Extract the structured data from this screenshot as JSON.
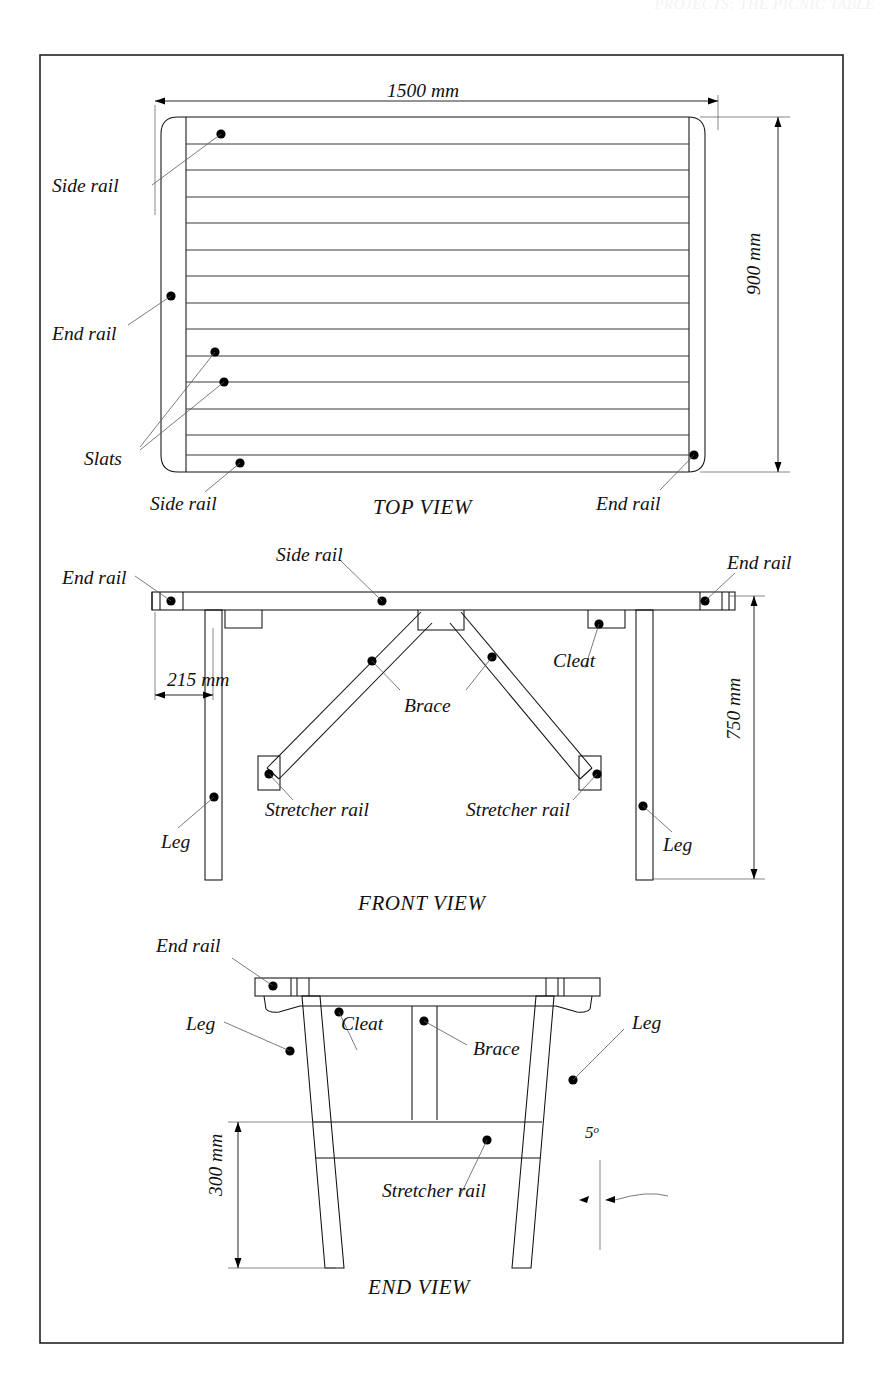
{
  "document": {
    "header_text": "PROJECTS: THE PICNIC TABLE",
    "frame": {
      "x": 40,
      "y": 55,
      "width": 803,
      "height": 1288
    }
  },
  "views": [
    {
      "id": "top-view",
      "title": "TOP VIEW",
      "dimensions": [
        {
          "name": "length",
          "value": "1500 mm",
          "orientation": "horizontal"
        },
        {
          "name": "width",
          "value": "900 mm",
          "orientation": "vertical"
        }
      ],
      "labels": [
        "Side rail",
        "End rail",
        "Slats",
        "Side rail",
        "End rail"
      ],
      "slat_count": 12
    },
    {
      "id": "front-view",
      "title": "FRONT VIEW",
      "dimensions": [
        {
          "name": "leg-inset",
          "value": "215 mm",
          "orientation": "horizontal"
        },
        {
          "name": "table-height",
          "value": "750 mm",
          "orientation": "vertical"
        }
      ],
      "labels": [
        "End rail",
        "Side rail",
        "End rail",
        "Cleat",
        "Brace",
        "Stretcher rail",
        "Stretcher rail",
        "Leg",
        "Leg"
      ]
    },
    {
      "id": "end-view",
      "title": "END VIEW",
      "dimensions": [
        {
          "name": "stretcher-height",
          "value": "300 mm",
          "orientation": "vertical"
        },
        {
          "name": "leg-splay-angle",
          "value": "5",
          "unit": "°",
          "orientation": "angle"
        }
      ],
      "labels": [
        "End rail",
        "Leg",
        "Cleat",
        "Brace",
        "Leg",
        "Stretcher rail"
      ]
    }
  ],
  "labels": {
    "side_rail": "Side rail",
    "end_rail": "End rail",
    "slats": "Slats",
    "cleat": "Cleat",
    "brace": "Brace",
    "stretcher_rail": "Stretcher rail",
    "leg": "Leg"
  },
  "titles": {
    "top": "TOP VIEW",
    "front": "FRONT VIEW",
    "end": "END VIEW"
  },
  "dimension_values": {
    "length_1500": "1500 mm",
    "width_900": "900 mm",
    "inset_215": "215 mm",
    "height_750": "750 mm",
    "height_300": "300 mm",
    "angle_5": "5",
    "degree_symbol": "o"
  },
  "colors": {
    "line": "#111111",
    "leader": "#5a5a5a",
    "background": "#ffffff",
    "header": "#f2f2f4"
  }
}
